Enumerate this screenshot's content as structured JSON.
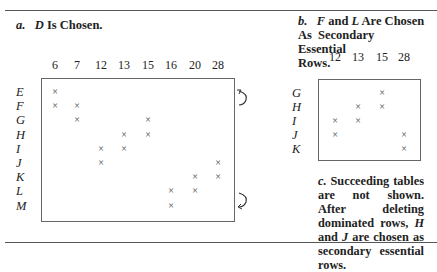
{
  "table_a": {
    "letter": "a.",
    "title_italic": "D",
    "title_rest": " Is Chosen.",
    "columns": [
      "6",
      "7",
      "12",
      "13",
      "15",
      "16",
      "20",
      "28"
    ],
    "rows": [
      "E",
      "F",
      "G",
      "H",
      "I",
      "J",
      "K",
      "L",
      "M"
    ],
    "marks": {
      "E": [
        "6"
      ],
      "F": [
        "6",
        "7"
      ],
      "G": [
        "7",
        "15"
      ],
      "H": [
        "13",
        "15"
      ],
      "I": [
        "12",
        "13"
      ],
      "J": [
        "12",
        "28"
      ],
      "K": [
        "20",
        "28"
      ],
      "L": [
        "16",
        "20"
      ],
      "M": [
        "16"
      ]
    },
    "annotations": [
      "curved arrow beside row E",
      "curved arrow beside row L"
    ]
  },
  "table_b": {
    "letter": "b.",
    "title_f": "F",
    "title_and": " and ",
    "title_l": "L",
    "title_line1_rest": " Are Chosen",
    "title_line2": "As Secondary Essential",
    "title_line3": "Rows.",
    "columns": [
      "12",
      "13",
      "15",
      "28"
    ],
    "rows": [
      "G",
      "H",
      "I",
      "J",
      "K"
    ],
    "marks": {
      "G": [
        "15"
      ],
      "H": [
        "13",
        "15"
      ],
      "I": [
        "12",
        "13"
      ],
      "J": [
        "12",
        "28"
      ],
      "K": [
        "28"
      ]
    }
  },
  "note_c": {
    "letter": "c.",
    "text_1": " Succeeding tables are not shown. After deleting dominated rows, ",
    "h": "H",
    "text_2": " and ",
    "j": "J",
    "text_3": " are chosen as secondary essential rows."
  },
  "mark_glyph": "×"
}
